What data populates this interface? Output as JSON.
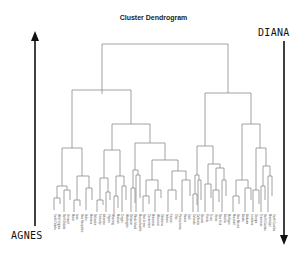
{
  "title": "Cluster Dendrogram",
  "labels": {
    "bottom_up": "AGNES",
    "top_down": "DIANA"
  },
  "arrows": {
    "agnes": {
      "direction": "up",
      "icon": "arrow-up-icon"
    },
    "diana": {
      "direction": "down",
      "icon": "arrow-down-icon"
    }
  },
  "dendrogram": {
    "line_color": "#8a8a8a",
    "top_split": "two main clusters",
    "leaves": [
      "South Dakota",
      "West Virginia",
      "North Dakota",
      "Vermont",
      "Maine",
      "Iowa",
      "New Hampshire",
      "Idaho",
      "Montana",
      "Nebraska",
      "Kentucky",
      "Arkansas",
      "Virginia",
      "Wyoming",
      "Missouri",
      "Oregon",
      "Washington",
      "Delaware",
      "Rhode Island",
      "Massachusetts",
      "New Jersey",
      "Connecticut",
      "Minnesota",
      "Wisconsin",
      "Oklahoma",
      "Indiana",
      "Kansas",
      "Ohio",
      "Pennsylvania",
      "Hawaii",
      "Utah",
      "Colorado",
      "California",
      "Nevada",
      "Florida",
      "Texas",
      "Illinois",
      "New York",
      "Arizona",
      "Michigan",
      "Maryland",
      "New Mexico",
      "Alaska",
      "Alabama",
      "Louisiana",
      "Georgia",
      "Tennessee",
      "North Carolina",
      "Mississippi",
      "South Carolina"
    ]
  }
}
